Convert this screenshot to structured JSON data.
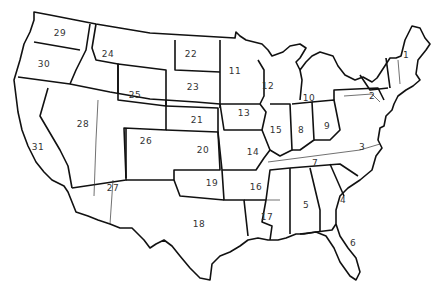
{
  "map": {
    "title": "United States regions",
    "background": "#ffffff",
    "line_color": "#111111",
    "regions": [
      {
        "id": "1",
        "label": "1",
        "state": "New England",
        "x": 406,
        "y": 55
      },
      {
        "id": "2",
        "label": "2",
        "state": "Pennsylvania / New Jersey",
        "x": 372,
        "y": 96
      },
      {
        "id": "3",
        "label": "3",
        "state": "Virginia / Maryland",
        "x": 362,
        "y": 147
      },
      {
        "id": "4",
        "label": "4",
        "state": "Georgia / South Carolina",
        "x": 343,
        "y": 200
      },
      {
        "id": "5",
        "label": "5",
        "state": "Alabama",
        "x": 306,
        "y": 205
      },
      {
        "id": "6",
        "label": "6",
        "state": "Florida",
        "x": 353,
        "y": 243
      },
      {
        "id": "7",
        "label": "7",
        "state": "Tennessee / Kentucky",
        "x": 315,
        "y": 163
      },
      {
        "id": "8",
        "label": "8",
        "state": "Indiana",
        "x": 301,
        "y": 130
      },
      {
        "id": "9",
        "label": "9",
        "state": "Ohio",
        "x": 327,
        "y": 126
      },
      {
        "id": "10",
        "label": "10",
        "state": "Michigan",
        "x": 309,
        "y": 98
      },
      {
        "id": "11",
        "label": "11",
        "state": "Minnesota",
        "x": 235,
        "y": 71
      },
      {
        "id": "12",
        "label": "12",
        "state": "Wisconsin",
        "x": 268,
        "y": 86
      },
      {
        "id": "13",
        "label": "13",
        "state": "Iowa",
        "x": 244,
        "y": 113
      },
      {
        "id": "14",
        "label": "14",
        "state": "Missouri",
        "x": 253,
        "y": 152
      },
      {
        "id": "15",
        "label": "15",
        "state": "Illinois",
        "x": 276,
        "y": 130
      },
      {
        "id": "16",
        "label": "16",
        "state": "Arkansas",
        "x": 256,
        "y": 187
      },
      {
        "id": "17",
        "label": "17",
        "state": "Louisiana",
        "x": 267,
        "y": 217
      },
      {
        "id": "18",
        "label": "18",
        "state": "Texas",
        "x": 199,
        "y": 224
      },
      {
        "id": "19",
        "label": "19",
        "state": "Oklahoma",
        "x": 212,
        "y": 183
      },
      {
        "id": "20",
        "label": "20",
        "state": "Kansas",
        "x": 203,
        "y": 150
      },
      {
        "id": "21",
        "label": "21",
        "state": "Nebraska",
        "x": 197,
        "y": 120
      },
      {
        "id": "22",
        "label": "22",
        "state": "North Dakota",
        "x": 191,
        "y": 54
      },
      {
        "id": "23",
        "label": "23",
        "state": "South Dakota",
        "x": 193,
        "y": 87
      },
      {
        "id": "24",
        "label": "24",
        "state": "Idaho / Montana",
        "x": 108,
        "y": 54
      },
      {
        "id": "25",
        "label": "25",
        "state": "Wyoming",
        "x": 135,
        "y": 95
      },
      {
        "id": "26",
        "label": "26",
        "state": "Colorado",
        "x": 146,
        "y": 141
      },
      {
        "id": "27",
        "label": "27",
        "state": "Arizona / New Mexico",
        "x": 113,
        "y": 188
      },
      {
        "id": "28",
        "label": "28",
        "state": "Nevada / Utah",
        "x": 83,
        "y": 124
      },
      {
        "id": "29",
        "label": "29",
        "state": "Washington",
        "x": 60,
        "y": 33
      },
      {
        "id": "30",
        "label": "30",
        "state": "Oregon",
        "x": 44,
        "y": 64
      },
      {
        "id": "31",
        "label": "31",
        "state": "California",
        "x": 38,
        "y": 147
      }
    ]
  }
}
